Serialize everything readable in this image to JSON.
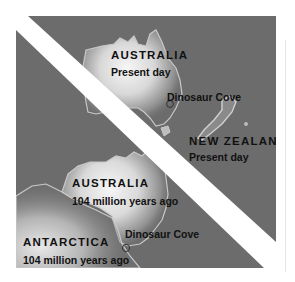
{
  "figure": {
    "top_panel": {
      "era": "Present day",
      "regions": [
        {
          "name": "AUSTRALIA",
          "subtitle": "Present day"
        },
        {
          "name": "NEW ZEALAND",
          "subtitle": "Present day"
        }
      ],
      "site": {
        "label": "Dinosaur Cove",
        "marker": "circle-marker-icon"
      }
    },
    "bottom_panel": {
      "era": "104 million years ago",
      "regions": [
        {
          "name": "AUSTRALIA",
          "subtitle": "104 million years ago"
        },
        {
          "name": "ANTARCTICA",
          "subtitle": "104 million years ago"
        }
      ],
      "site": {
        "label": "Dinosaur Cove",
        "marker": "circle-marker-icon"
      }
    },
    "divider": "diagonal-white-band",
    "colors": {
      "ocean": "#6c6c6c",
      "land_glow": "#f4f4f4",
      "coastline": "#c8c8c8",
      "divider": "#ffffff",
      "text": "#111111"
    }
  }
}
